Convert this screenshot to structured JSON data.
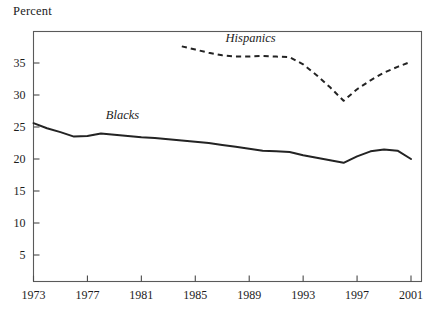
{
  "figure": {
    "y_axis_unit_label": "Percent"
  },
  "chart_data": {
    "type": "line",
    "title": "",
    "subtitle": "",
    "xlabel": "",
    "ylabel": "Percent",
    "xlim": [
      1973,
      2001
    ],
    "ylim": [
      0,
      38
    ],
    "yticks": [
      5,
      10,
      15,
      20,
      25,
      30,
      35
    ],
    "ytick_labels": [
      "5",
      "10",
      "15",
      "20",
      "25",
      "30",
      "35"
    ],
    "xticks": [
      1973,
      1977,
      1981,
      1985,
      1989,
      1993,
      1997,
      2001
    ],
    "xtick_labels": [
      "1973",
      "1977",
      "1981",
      "1985",
      "1989",
      "1993",
      "1997",
      "2001"
    ],
    "grid": false,
    "legend_position": "inline-annotation",
    "series": [
      {
        "name": "Blacks",
        "style": "solid",
        "color": "#232323",
        "label_x": 1979.6,
        "label_y": 26.3,
        "x": [
          1973,
          1974,
          1975,
          1976,
          1977,
          1978,
          1979,
          1980,
          1981,
          1982,
          1983,
          1984,
          1985,
          1986,
          1987,
          1988,
          1989,
          1990,
          1991,
          1992,
          1993,
          1994,
          1995,
          1996,
          1997,
          1998,
          1999,
          2000,
          2001
        ],
        "values": [
          25.6,
          24.8,
          24.2,
          23.5,
          23.6,
          24.0,
          23.8,
          23.6,
          23.4,
          23.3,
          23.1,
          22.9,
          22.7,
          22.5,
          22.2,
          21.9,
          21.6,
          21.3,
          21.2,
          21.1,
          20.6,
          20.2,
          19.8,
          19.4,
          20.4,
          21.2,
          21.5,
          21.3,
          20.0
        ],
        "units": "percent"
      },
      {
        "name": "Hispanics",
        "style": "dashed",
        "color": "#232323",
        "label_x": 1989.1,
        "label_y": 38.3,
        "x": [
          1984,
          1985,
          1986,
          1987,
          1988,
          1989,
          1990,
          1991,
          1992,
          1993,
          1994,
          1995,
          1996,
          1997,
          1998,
          1999,
          2000,
          2001
        ],
        "values": [
          37.6,
          37.1,
          36.6,
          36.2,
          36.0,
          36.0,
          36.1,
          36.0,
          35.9,
          34.8,
          33.1,
          31.2,
          29.1,
          30.9,
          32.3,
          33.5,
          34.4,
          35.2
        ],
        "units": "percent"
      }
    ]
  }
}
